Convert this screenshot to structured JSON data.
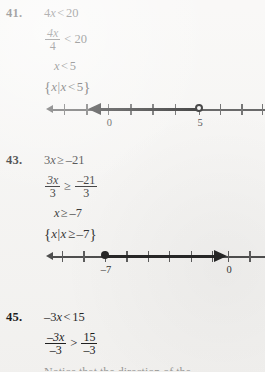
{
  "page": {
    "type": "textbook-worked-solutions",
    "background_color": "#f6f5f3",
    "text_color": "#141414"
  },
  "problems": [
    {
      "number": "41.",
      "steps": [
        {
          "kind": "inline",
          "lhs": "4",
          "lhs_var": "x",
          "rel": "<",
          "rhs": "20"
        },
        {
          "kind": "fraction",
          "num": "4x",
          "den": "4",
          "rel": "<",
          "rhs": "20"
        },
        {
          "kind": "inline",
          "lhs": "",
          "lhs_var": "x",
          "rel": "<",
          "rhs": "5"
        },
        {
          "kind": "set",
          "text": "{x|x<5}",
          "open_brace": "{",
          "var1": "x",
          "pipe": "|",
          "var2": "x",
          "rel": "<",
          "value": "5",
          "close_brace": "}"
        }
      ],
      "numberline": {
        "labels": [
          {
            "text": "0",
            "pos_pct": 27.5
          },
          {
            "text": "5",
            "pos_pct": 67.5
          }
        ],
        "tick_count": 11,
        "endpoint": {
          "value": "5",
          "style": "open",
          "pos_pct": 67.5
        },
        "ray": {
          "direction": "left",
          "from_pct": 67.5,
          "to_pct": 24.5
        }
      }
    },
    {
      "number": "43.",
      "steps": [
        {
          "kind": "inline",
          "lhs": "3",
          "lhs_var": "x",
          "rel": "≥",
          "rhs": "–21"
        },
        {
          "kind": "fraction",
          "num": "3x",
          "den": "3",
          "rel": "≥",
          "num2": "–21",
          "den2": "3"
        },
        {
          "kind": "inline",
          "lhs": "",
          "lhs_var": "x",
          "rel": "≥",
          "rhs": "–7"
        },
        {
          "kind": "set",
          "text": "{x|x≥–7}",
          "open_brace": "{",
          "var1": "x",
          "pipe": "|",
          "var2": "x",
          "rel": "≥",
          "value": "–7",
          "close_brace": "}"
        }
      ],
      "numberline": {
        "labels": [
          {
            "text": "–7",
            "pos_pct": 26.0
          },
          {
            "text": "0",
            "pos_pct": 80.0
          }
        ],
        "tick_count": 11,
        "endpoint": {
          "value": "–7",
          "style": "closed",
          "pos_pct": 26.0
        },
        "ray": {
          "direction": "right",
          "from_pct": 26.0,
          "to_pct": 75.0
        }
      }
    },
    {
      "number": "45.",
      "steps": [
        {
          "kind": "inline",
          "lhs": "–3",
          "lhs_var": "x",
          "rel": "<",
          "rhs": "15"
        },
        {
          "kind": "fraction",
          "num": "–3x",
          "den": "–3",
          "rel": ">",
          "num2": "15",
          "den2": "–3"
        }
      ],
      "cutoff_text": "Notice that the direction of the"
    }
  ],
  "symbols": {
    "lt": "<",
    "gt": ">",
    "ge": "≥",
    "minus": "–"
  }
}
